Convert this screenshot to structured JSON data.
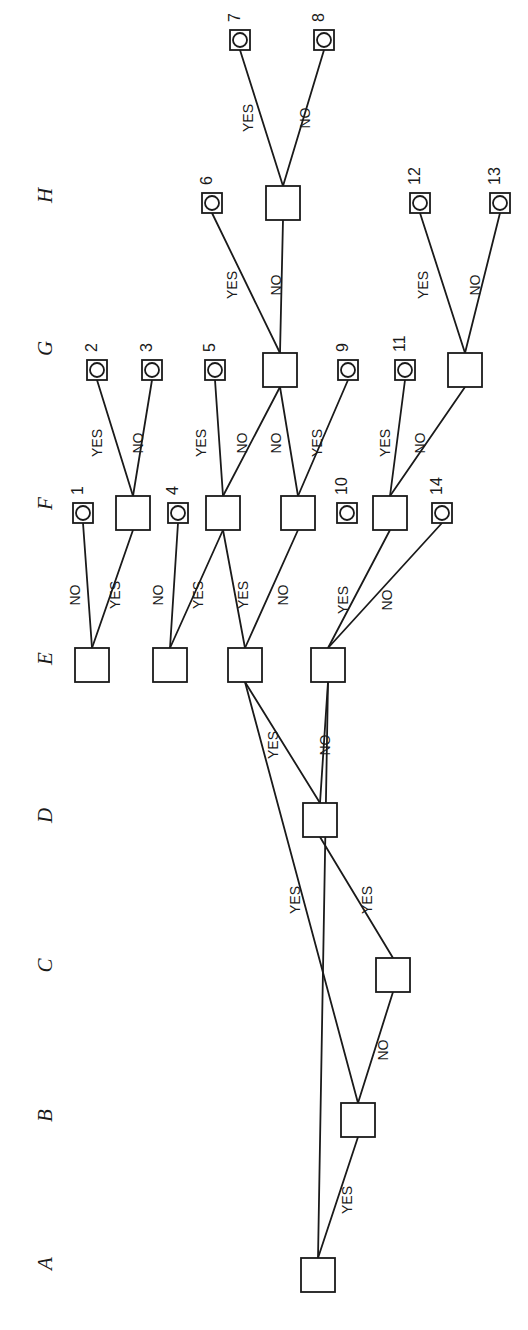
{
  "diagram": {
    "orientation": "rotated-90-ccw",
    "column_headers": [
      {
        "label": "A",
        "x": 45,
        "y": 1265
      },
      {
        "label": "B",
        "x": 45,
        "y": 1117
      },
      {
        "label": "C",
        "x": 45,
        "y": 967
      },
      {
        "label": "D",
        "x": 45,
        "y": 817
      },
      {
        "label": "E",
        "x": 45,
        "y": 660
      },
      {
        "label": "F",
        "x": 45,
        "y": 505
      },
      {
        "label": "G",
        "x": 45,
        "y": 350
      },
      {
        "label": "H",
        "x": 45,
        "y": 197
      }
    ],
    "edge_label_yes": "YES",
    "edge_label_no": "NO",
    "decision_nodes": [
      {
        "id": "A1",
        "column": "A",
        "x": 318,
        "y": 1275
      },
      {
        "id": "B1",
        "column": "B",
        "x": 358,
        "y": 1120
      },
      {
        "id": "C1",
        "column": "C",
        "x": 393,
        "y": 975
      },
      {
        "id": "D1",
        "column": "D",
        "x": 320,
        "y": 820
      },
      {
        "id": "E1",
        "column": "E",
        "x": 92,
        "y": 665
      },
      {
        "id": "E2",
        "column": "E",
        "x": 170,
        "y": 665
      },
      {
        "id": "E3",
        "column": "E",
        "x": 245,
        "y": 665
      },
      {
        "id": "E4",
        "column": "E",
        "x": 328,
        "y": 665
      },
      {
        "id": "F1",
        "column": "F",
        "x": 133,
        "y": 513
      },
      {
        "id": "F2",
        "column": "F",
        "x": 223,
        "y": 513
      },
      {
        "id": "F3",
        "column": "F",
        "x": 298,
        "y": 513
      },
      {
        "id": "F4",
        "column": "F",
        "x": 390,
        "y": 513
      },
      {
        "id": "G1",
        "column": "G",
        "x": 280,
        "y": 370
      },
      {
        "id": "G2",
        "column": "G",
        "x": 465,
        "y": 370
      },
      {
        "id": "H1",
        "column": "H",
        "x": 283,
        "y": 203
      }
    ],
    "leaf_nodes": [
      {
        "label": "1",
        "column": "F",
        "x": 83,
        "y": 513
      },
      {
        "label": "2",
        "column": "G",
        "x": 97,
        "y": 370
      },
      {
        "label": "3",
        "column": "G",
        "x": 152,
        "y": 370
      },
      {
        "label": "4",
        "column": "F",
        "x": 178,
        "y": 513
      },
      {
        "label": "5",
        "column": "G",
        "x": 215,
        "y": 370
      },
      {
        "label": "6",
        "column": "H",
        "x": 212,
        "y": 203
      },
      {
        "label": "7",
        "column": "I",
        "x": 240,
        "y": 40
      },
      {
        "label": "8",
        "column": "I",
        "x": 324,
        "y": 40
      },
      {
        "label": "9",
        "column": "G",
        "x": 348,
        "y": 370
      },
      {
        "label": "10",
        "column": "F",
        "x": 347,
        "y": 513
      },
      {
        "label": "11",
        "column": "G",
        "x": 405,
        "y": 370
      },
      {
        "label": "12",
        "column": "H",
        "x": 420,
        "y": 203
      },
      {
        "label": "13",
        "column": "H",
        "x": 500,
        "y": 203
      },
      {
        "label": "14",
        "column": "F",
        "x": 442,
        "y": 513
      }
    ],
    "edges": [
      {
        "from": "A1",
        "to": "B1",
        "label": "YES",
        "lx": 352,
        "ly": 1200
      },
      {
        "from": "A1",
        "to": "E4",
        "label": "",
        "lx": 0,
        "ly": 0
      },
      {
        "from": "B1",
        "to": "C1",
        "label": "NO",
        "lx": 388,
        "ly": 1050
      },
      {
        "from": "B1",
        "to": "E3",
        "label": "YES",
        "lx": 300,
        "ly": 900
      },
      {
        "from": "C1",
        "to": "D1",
        "label": "YES",
        "lx": 372,
        "ly": 900
      },
      {
        "from": "D1",
        "to": "E3",
        "label": "YES",
        "lx": 278,
        "ly": 745
      },
      {
        "from": "D1",
        "to": "E4",
        "label": "NO",
        "lx": 330,
        "ly": 745
      },
      {
        "from": "E1",
        "to": "L1",
        "label": "NO",
        "lx": 80,
        "ly": 595
      },
      {
        "from": "E1",
        "to": "F1",
        "label": "YES",
        "lx": 120,
        "ly": 595
      },
      {
        "from": "E2",
        "to": "L4",
        "label": "NO",
        "lx": 163,
        "ly": 595
      },
      {
        "from": "E2",
        "to": "F2",
        "label": "YES",
        "lx": 203,
        "ly": 595
      },
      {
        "from": "E3",
        "to": "F2",
        "label": "YES",
        "lx": 248,
        "ly": 595
      },
      {
        "from": "E3",
        "to": "F3",
        "label": "NO",
        "lx": 288,
        "ly": 595
      },
      {
        "from": "E4",
        "to": "F4",
        "label": "YES",
        "lx": 348,
        "ly": 600
      },
      {
        "from": "E4",
        "to": "L14",
        "label": "NO",
        "lx": 392,
        "ly": 600
      },
      {
        "from": "F1",
        "to": "L2",
        "label": "YES",
        "lx": 102,
        "ly": 443
      },
      {
        "from": "F1",
        "to": "L3",
        "label": "NO",
        "lx": 143,
        "ly": 443
      },
      {
        "from": "F2",
        "to": "L5",
        "label": "YES",
        "lx": 206,
        "ly": 443
      },
      {
        "from": "F2",
        "to": "G1",
        "label": "NO",
        "lx": 247,
        "ly": 443
      },
      {
        "from": "F3",
        "to": "G1",
        "label": "NO",
        "lx": 281,
        "ly": 443
      },
      {
        "from": "F3",
        "to": "L9",
        "label": "YES",
        "lx": 322,
        "ly": 443
      },
      {
        "from": "F4",
        "to": "L11",
        "label": "YES",
        "lx": 390,
        "ly": 443
      },
      {
        "from": "F4",
        "to": "G2",
        "label": "NO",
        "lx": 425,
        "ly": 443
      },
      {
        "from": "G1",
        "to": "L6",
        "label": "YES",
        "lx": 237,
        "ly": 285
      },
      {
        "from": "G1",
        "to": "H1",
        "label": "NO",
        "lx": 281,
        "ly": 285
      },
      {
        "from": "G2",
        "to": "L12",
        "label": "YES",
        "lx": 428,
        "ly": 285
      },
      {
        "from": "G2",
        "to": "L13",
        "label": "NO",
        "lx": 480,
        "ly": 285
      },
      {
        "from": "H1",
        "to": "L7",
        "label": "YES",
        "lx": 253,
        "ly": 118
      },
      {
        "from": "H1",
        "to": "L8",
        "label": "NO",
        "lx": 310,
        "ly": 118
      }
    ],
    "style": {
      "stroke": "#1a1a1a",
      "fill": "#ffffff",
      "node_size": 34,
      "leaf_size": 20,
      "leaf_circle_r": 7
    }
  }
}
